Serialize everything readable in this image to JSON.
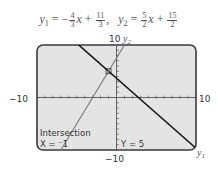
{
  "equations": {
    "y1": {
      "name": "y",
      "sub": "1",
      "sign": "−",
      "coef_num": "4",
      "coef_den": "3",
      "var": "x",
      "op": "+",
      "const_num": "11",
      "const_den": "3",
      "sep": ","
    },
    "y2": {
      "name": "y",
      "sub": "2",
      "sign": "",
      "coef_num": "5",
      "coef_den": "2",
      "var": "x",
      "op": "+",
      "const_num": "15",
      "const_den": "2"
    }
  },
  "chart_data": {
    "type": "line",
    "xlim": [
      -10,
      10
    ],
    "ylim": [
      -10,
      10
    ],
    "xscale": 1,
    "yscale": 1,
    "tick_labels": {
      "xmin": "−10",
      "xmax": "10",
      "ymin": "−10",
      "ymax": "10"
    },
    "series": [
      {
        "name": "y1",
        "label": "y",
        "sub": "1",
        "slope": -1.3333,
        "intercept": 3.6667,
        "x": [
          -10,
          10
        ],
        "y": [
          17,
          -9.67
        ],
        "color": "#1a1a1a"
      },
      {
        "name": "y2",
        "label": "y",
        "sub": "2",
        "slope": 2.5,
        "intercept": 7.5,
        "x": [
          -7,
          1
        ],
        "y": [
          -10,
          10
        ],
        "color": "#7a7a7a"
      }
    ],
    "intersection": {
      "x": -1,
      "y": 5
    },
    "screen_text": {
      "heading": "Intersection",
      "x_readout": "X = ⁻1",
      "y_readout": "Y = 5"
    },
    "colors": {
      "screen_bg": "#e4e4e4",
      "screen_border": "#3a3a3a",
      "axis": "#444444"
    }
  }
}
